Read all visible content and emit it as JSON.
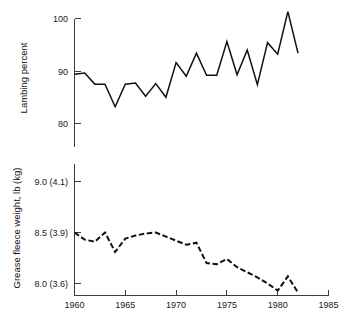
{
  "figure": {
    "background": "#ffffff",
    "line_color": "#111111",
    "axis_color": "#3c3c3c"
  },
  "chart_data": [
    {
      "type": "line",
      "id": "lambing-percent",
      "title": "",
      "xlabel": "",
      "ylabel": "Lambing percent",
      "xlim": [
        1960,
        1985
      ],
      "ylim": [
        76.5,
        101.5
      ],
      "grid": false,
      "legend": "none",
      "line_style": "solid",
      "yticks": [
        80,
        90,
        100
      ],
      "ytick_labels": [
        "80",
        "90",
        "100"
      ],
      "xticks": [
        1960,
        1965,
        1970,
        1975,
        1980,
        1985
      ],
      "xtick_labels": [
        "",
        "",
        "",
        "",
        "",
        ""
      ],
      "x": [
        1960,
        1961,
        1962,
        1963,
        1964,
        1965,
        1966,
        1967,
        1968,
        1969,
        1970,
        1971,
        1972,
        1973,
        1974,
        1975,
        1976,
        1977,
        1978,
        1979,
        1980,
        1981,
        1982
      ],
      "values": [
        89.4,
        89.6,
        87.5,
        87.5,
        83.2,
        87.5,
        87.7,
        85.2,
        87.6,
        85.0,
        91.6,
        89.0,
        93.4,
        89.2,
        89.2,
        95.6,
        89.3,
        94.0,
        87.4,
        95.4,
        93.2,
        101.3,
        93.4
      ]
    },
    {
      "type": "line",
      "id": "grease-fleece-weight",
      "title": "",
      "xlabel": "",
      "ylabel": "Grease fleece weight, lb (kg)",
      "xlim": [
        1960,
        1985
      ],
      "ylim": [
        7.82,
        9.18
      ],
      "grid": false,
      "legend": "none",
      "line_style": "dashed",
      "yticks": [
        8.0,
        8.5,
        9.0
      ],
      "ytick_labels": [
        "8.0 (3.6)",
        "8.5 (3.9)",
        "9.0 (4.1)"
      ],
      "xticks": [
        1960,
        1965,
        1970,
        1975,
        1980,
        1985
      ],
      "xtick_labels": [
        "1960",
        "1965",
        "1970",
        "1975",
        "1980",
        "1985"
      ],
      "x": [
        1960,
        1961,
        1962,
        1963,
        1964,
        1965,
        1966,
        1967,
        1968,
        1969,
        1970,
        1971,
        1972,
        1973,
        1974,
        1975,
        1976,
        1977,
        1978,
        1979,
        1980,
        1981,
        1982
      ],
      "values": [
        8.5,
        8.43,
        8.41,
        8.5,
        8.31,
        8.44,
        8.47,
        8.49,
        8.5,
        8.46,
        8.42,
        8.38,
        8.4,
        8.2,
        8.19,
        8.24,
        8.16,
        8.11,
        8.06,
        8.0,
        7.93,
        8.07,
        7.91
      ]
    }
  ]
}
